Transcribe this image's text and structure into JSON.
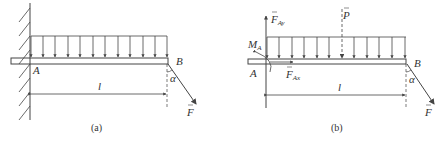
{
  "figures": [
    {
      "id": "a",
      "caption": "(a)",
      "labels": {
        "A": "A",
        "B": "B",
        "length": "l",
        "angle": "α",
        "force": "F"
      }
    },
    {
      "id": "b",
      "caption": "(b)",
      "labels": {
        "A": "A",
        "B": "B",
        "length": "l",
        "angle": "α",
        "force": "F",
        "moment": "M",
        "moment_sub": "A",
        "fay": "F",
        "fay_sub": "Ay",
        "fax": "F",
        "fax_sub": "Ax",
        "p": "P"
      }
    }
  ],
  "colors": {
    "stroke": "#444444",
    "background": "#ffffff"
  }
}
